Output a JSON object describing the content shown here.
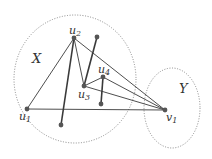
{
  "diagram": {
    "sets": [
      {
        "id": "X",
        "label": "X",
        "cx": 75,
        "cy": 79,
        "rx": 61,
        "ry": 64,
        "label_pos": [
          32,
          63
        ]
      },
      {
        "id": "Y",
        "label": "Y",
        "cx": 172,
        "cy": 108,
        "rx": 28,
        "ry": 40,
        "label_pos": [
          179,
          93
        ]
      }
    ],
    "vertices": [
      {
        "id": "u1",
        "label": "u1",
        "main": "u",
        "sub": "1",
        "x": 27,
        "y": 109,
        "lx": 19,
        "ly": 120
      },
      {
        "id": "u2",
        "label": "u2",
        "main": "u",
        "sub": "2",
        "x": 74,
        "y": 38,
        "lx": 69,
        "ly": 34
      },
      {
        "id": "u3",
        "label": "u3",
        "main": "u",
        "sub": "3",
        "x": 84,
        "y": 86,
        "lx": 78,
        "ly": 98
      },
      {
        "id": "u4",
        "label": "u4",
        "main": "u",
        "sub": "4",
        "x": 103,
        "y": 77,
        "lx": 98,
        "ly": 73
      },
      {
        "id": "v1",
        "label": "v1",
        "main": "v",
        "sub": "1",
        "x": 165,
        "y": 110,
        "lx": 166,
        "ly": 121
      },
      {
        "id": "a",
        "label": "",
        "x": 97,
        "y": 37
      },
      {
        "id": "b",
        "label": "",
        "x": 61,
        "y": 125
      },
      {
        "id": "c",
        "label": "",
        "x": 101,
        "y": 104
      }
    ],
    "edges": [
      {
        "from": "u1",
        "to": "u2",
        "thick": false
      },
      {
        "from": "u1",
        "to": "v1",
        "thick": false
      },
      {
        "from": "u2",
        "to": "u3",
        "thick": false
      },
      {
        "from": "u2",
        "to": "v1",
        "thick": false
      },
      {
        "from": "u2",
        "to": "b",
        "thick": true
      },
      {
        "from": "a",
        "to": "u3",
        "thick": true
      },
      {
        "from": "u3",
        "to": "u4",
        "thick": false
      },
      {
        "from": "u3",
        "to": "v1",
        "thick": false
      },
      {
        "from": "u4",
        "to": "v1",
        "thick": false
      },
      {
        "from": "u4",
        "to": "c",
        "thick": true
      }
    ],
    "colors": {
      "line": "#3a3a3a",
      "dot": "#555555",
      "ellipse": "#888888"
    }
  }
}
